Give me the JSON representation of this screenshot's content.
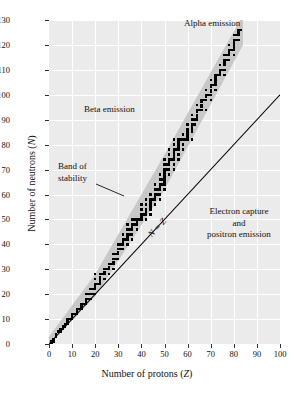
{
  "figure": {
    "title": "",
    "axes": {
      "xlabel_pre": "Number of protons (",
      "xlabel_var": "Z",
      "xlabel_post": ")",
      "ylabel_pre": "Number of neutrons (",
      "ylabel_var": "N",
      "ylabel_post": ")"
    }
  },
  "annotations": {
    "alpha_emission": "Alpha emission",
    "beta_emission": "Beta emission",
    "band_of_stability_line1": "Band of",
    "band_of_stability_line2": "stability",
    "electron_capture_line1": "Electron capture",
    "electron_capture_line2": "and",
    "electron_capture_line3": "positron emission",
    "nz_line": "N = Z"
  },
  "colors": {
    "plot_background": "#ebebeb",
    "gridline": "#ffffff",
    "band_fill": "#c8c8c8",
    "point_fill": "#000000",
    "axis": "#333333",
    "text": "#111111"
  },
  "chart_data": {
    "type": "scatter",
    "title": "",
    "xlabel": "Number of protons (Z)",
    "ylabel": "Number of neutrons (N)",
    "xlim": [
      0,
      100
    ],
    "ylim": [
      0,
      130
    ],
    "xticks": [
      0,
      10,
      20,
      30,
      40,
      50,
      60,
      70,
      80,
      90,
      100
    ],
    "yticks": [
      0,
      10,
      20,
      30,
      40,
      50,
      60,
      70,
      80,
      90,
      100,
      110,
      120,
      130
    ],
    "grid": true,
    "legend": "none",
    "series": [
      {
        "name": "Stable nuclides",
        "marker": "square",
        "marker_size_px": 2.4,
        "color": "#000000",
        "points": [
          [
            1,
            0
          ],
          [
            1,
            1
          ],
          [
            2,
            1
          ],
          [
            2,
            2
          ],
          [
            3,
            3
          ],
          [
            3,
            4
          ],
          [
            4,
            5
          ],
          [
            5,
            5
          ],
          [
            5,
            6
          ],
          [
            6,
            6
          ],
          [
            6,
            7
          ],
          [
            7,
            7
          ],
          [
            7,
            8
          ],
          [
            8,
            8
          ],
          [
            8,
            9
          ],
          [
            8,
            10
          ],
          [
            9,
            10
          ],
          [
            10,
            10
          ],
          [
            10,
            11
          ],
          [
            10,
            12
          ],
          [
            11,
            12
          ],
          [
            12,
            12
          ],
          [
            12,
            13
          ],
          [
            12,
            14
          ],
          [
            13,
            14
          ],
          [
            14,
            14
          ],
          [
            14,
            15
          ],
          [
            14,
            16
          ],
          [
            15,
            16
          ],
          [
            16,
            16
          ],
          [
            16,
            17
          ],
          [
            16,
            18
          ],
          [
            16,
            20
          ],
          [
            17,
            18
          ],
          [
            17,
            20
          ],
          [
            18,
            18
          ],
          [
            18,
            20
          ],
          [
            18,
            22
          ],
          [
            19,
            20
          ],
          [
            19,
            22
          ],
          [
            20,
            20
          ],
          [
            20,
            22
          ],
          [
            20,
            23
          ],
          [
            20,
            24
          ],
          [
            20,
            26
          ],
          [
            20,
            28
          ],
          [
            21,
            24
          ],
          [
            22,
            24
          ],
          [
            22,
            25
          ],
          [
            22,
            26
          ],
          [
            22,
            27
          ],
          [
            22,
            28
          ],
          [
            23,
            28
          ],
          [
            24,
            26
          ],
          [
            24,
            28
          ],
          [
            24,
            29
          ],
          [
            24,
            30
          ],
          [
            25,
            30
          ],
          [
            26,
            28
          ],
          [
            26,
            30
          ],
          [
            26,
            31
          ],
          [
            26,
            32
          ],
          [
            27,
            32
          ],
          [
            28,
            30
          ],
          [
            28,
            32
          ],
          [
            28,
            33
          ],
          [
            28,
            34
          ],
          [
            28,
            36
          ],
          [
            29,
            34
          ],
          [
            29,
            36
          ],
          [
            30,
            34
          ],
          [
            30,
            36
          ],
          [
            30,
            37
          ],
          [
            30,
            38
          ],
          [
            30,
            40
          ],
          [
            31,
            38
          ],
          [
            31,
            40
          ],
          [
            32,
            38
          ],
          [
            32,
            40
          ],
          [
            32,
            41
          ],
          [
            32,
            42
          ],
          [
            32,
            44
          ],
          [
            33,
            42
          ],
          [
            34,
            40
          ],
          [
            34,
            42
          ],
          [
            34,
            43
          ],
          [
            34,
            44
          ],
          [
            34,
            46
          ],
          [
            34,
            48
          ],
          [
            35,
            44
          ],
          [
            35,
            46
          ],
          [
            36,
            42
          ],
          [
            36,
            44
          ],
          [
            36,
            46
          ],
          [
            36,
            47
          ],
          [
            36,
            48
          ],
          [
            36,
            50
          ],
          [
            37,
            48
          ],
          [
            37,
            50
          ],
          [
            38,
            46
          ],
          [
            38,
            48
          ],
          [
            38,
            49
          ],
          [
            38,
            50
          ],
          [
            39,
            50
          ],
          [
            40,
            50
          ],
          [
            40,
            51
          ],
          [
            40,
            52
          ],
          [
            40,
            54
          ],
          [
            40,
            56
          ],
          [
            41,
            52
          ],
          [
            42,
            50
          ],
          [
            42,
            52
          ],
          [
            42,
            53
          ],
          [
            42,
            54
          ],
          [
            42,
            56
          ],
          [
            42,
            58
          ],
          [
            44,
            52
          ],
          [
            44,
            54
          ],
          [
            44,
            55
          ],
          [
            44,
            56
          ],
          [
            44,
            57
          ],
          [
            44,
            58
          ],
          [
            44,
            60
          ],
          [
            45,
            58
          ],
          [
            46,
            56
          ],
          [
            46,
            58
          ],
          [
            46,
            59
          ],
          [
            46,
            60
          ],
          [
            46,
            62
          ],
          [
            46,
            64
          ],
          [
            47,
            60
          ],
          [
            47,
            62
          ],
          [
            48,
            58
          ],
          [
            48,
            60
          ],
          [
            48,
            62
          ],
          [
            48,
            63
          ],
          [
            48,
            64
          ],
          [
            48,
            66
          ],
          [
            48,
            68
          ],
          [
            49,
            64
          ],
          [
            49,
            66
          ],
          [
            50,
            62
          ],
          [
            50,
            64
          ],
          [
            50,
            65
          ],
          [
            50,
            66
          ],
          [
            50,
            67
          ],
          [
            50,
            68
          ],
          [
            50,
            69
          ],
          [
            50,
            70
          ],
          [
            50,
            72
          ],
          [
            50,
            74
          ],
          [
            51,
            70
          ],
          [
            51,
            72
          ],
          [
            52,
            68
          ],
          [
            52,
            70
          ],
          [
            52,
            72
          ],
          [
            52,
            73
          ],
          [
            52,
            74
          ],
          [
            52,
            76
          ],
          [
            52,
            78
          ],
          [
            53,
            74
          ],
          [
            54,
            70
          ],
          [
            54,
            72
          ],
          [
            54,
            74
          ],
          [
            54,
            75
          ],
          [
            54,
            76
          ],
          [
            54,
            77
          ],
          [
            54,
            78
          ],
          [
            54,
            80
          ],
          [
            54,
            82
          ],
          [
            55,
            78
          ],
          [
            56,
            74
          ],
          [
            56,
            76
          ],
          [
            56,
            78
          ],
          [
            56,
            79
          ],
          [
            56,
            80
          ],
          [
            56,
            81
          ],
          [
            56,
            82
          ],
          [
            57,
            82
          ],
          [
            58,
            78
          ],
          [
            58,
            80
          ],
          [
            58,
            82
          ],
          [
            58,
            84
          ],
          [
            59,
            82
          ],
          [
            60,
            82
          ],
          [
            60,
            83
          ],
          [
            60,
            84
          ],
          [
            60,
            85
          ],
          [
            60,
            86
          ],
          [
            60,
            88
          ],
          [
            62,
            82
          ],
          [
            62,
            85
          ],
          [
            62,
            86
          ],
          [
            62,
            87
          ],
          [
            62,
            88
          ],
          [
            62,
            90
          ],
          [
            62,
            92
          ],
          [
            63,
            88
          ],
          [
            63,
            90
          ],
          [
            64,
            90
          ],
          [
            64,
            91
          ],
          [
            64,
            92
          ],
          [
            64,
            93
          ],
          [
            64,
            94
          ],
          [
            64,
            96
          ],
          [
            65,
            94
          ],
          [
            66,
            94
          ],
          [
            66,
            95
          ],
          [
            66,
            96
          ],
          [
            66,
            97
          ],
          [
            66,
            98
          ],
          [
            67,
            98
          ],
          [
            68,
            94
          ],
          [
            68,
            98
          ],
          [
            68,
            99
          ],
          [
            68,
            100
          ],
          [
            68,
            102
          ],
          [
            69,
            100
          ],
          [
            70,
            98
          ],
          [
            70,
            100
          ],
          [
            70,
            101
          ],
          [
            70,
            102
          ],
          [
            70,
            103
          ],
          [
            70,
            104
          ],
          [
            70,
            106
          ],
          [
            71,
            104
          ],
          [
            72,
            102
          ],
          [
            72,
            104
          ],
          [
            72,
            105
          ],
          [
            72,
            106
          ],
          [
            72,
            107
          ],
          [
            72,
            108
          ],
          [
            73,
            108
          ],
          [
            74,
            108
          ],
          [
            74,
            109
          ],
          [
            74,
            110
          ],
          [
            74,
            112
          ],
          [
            75,
            110
          ],
          [
            76,
            108
          ],
          [
            76,
            110
          ],
          [
            76,
            112
          ],
          [
            76,
            113
          ],
          [
            76,
            114
          ],
          [
            76,
            116
          ],
          [
            77,
            114
          ],
          [
            77,
            116
          ],
          [
            78,
            114
          ],
          [
            78,
            116
          ],
          [
            78,
            117
          ],
          [
            78,
            118
          ],
          [
            78,
            120
          ],
          [
            79,
            118
          ],
          [
            80,
            116
          ],
          [
            80,
            118
          ],
          [
            80,
            119
          ],
          [
            80,
            120
          ],
          [
            80,
            121
          ],
          [
            80,
            122
          ],
          [
            80,
            124
          ],
          [
            81,
            122
          ],
          [
            81,
            124
          ],
          [
            82,
            122
          ],
          [
            82,
            124
          ],
          [
            82,
            125
          ],
          [
            82,
            126
          ],
          [
            83,
            126
          ]
        ]
      }
    ],
    "shaded_region": {
      "name": "Band of stability",
      "fill": "#c8c8c8",
      "lower_boundary": [
        [
          0,
          0
        ],
        [
          20,
          19
        ],
        [
          50,
          62
        ],
        [
          84,
          120
        ]
      ],
      "upper_boundary": [
        [
          0,
          3
        ],
        [
          20,
          28
        ],
        [
          50,
          76
        ],
        [
          84,
          132
        ]
      ]
    },
    "reference_line": {
      "name": "N = Z",
      "from": [
        0,
        0
      ],
      "to": [
        100,
        100
      ],
      "color": "#000000"
    }
  }
}
